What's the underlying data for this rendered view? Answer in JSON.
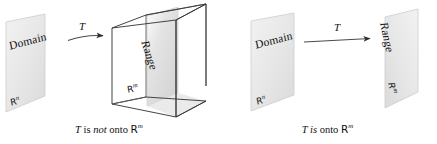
{
  "figure": {
    "kind": "math-diagram",
    "background_color": "#ffffff",
    "ink_color": "#111111",
    "plane_fill": "#e9e9e9",
    "plane_stroke": "#c9c9c9",
    "cube_stroke": "#3a3a3a",
    "range_plane_fill": "#dcdcdc"
  },
  "left_panel": {
    "name": "not-onto",
    "domain_plane": {
      "title": "Domain",
      "space": "R",
      "space_exponent": "n"
    },
    "arrow": {
      "label": "T",
      "style": "curved"
    },
    "cube": {
      "range_plane": {
        "title": "Range"
      },
      "floor_space": "R",
      "floor_exponent": "m"
    },
    "caption": {
      "part1": "T",
      "part2": " is ",
      "part3": "not",
      "part4": " onto ",
      "space": "R",
      "space_exponent": "m"
    }
  },
  "right_panel": {
    "name": "onto",
    "domain_plane": {
      "title": "Domain",
      "space": "R",
      "space_exponent": "n"
    },
    "arrow": {
      "label": "T",
      "style": "straight"
    },
    "range_plane": {
      "title": "Range",
      "space": "R",
      "space_exponent": "m"
    },
    "caption": {
      "part1": "T",
      "part2": " is",
      "part3": "",
      "part4": " onto ",
      "space": "R",
      "space_exponent": "m"
    }
  }
}
